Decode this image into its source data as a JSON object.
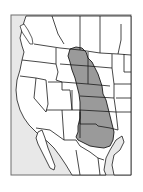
{
  "map": {
    "title": "",
    "region": "Western and Central United States with northern Mexico",
    "colors": {
      "background": "#ffffff",
      "ocean": "#e8e8e8",
      "land": "#ffffff",
      "border": "#1a1a1a",
      "highlight_range": "#9a9a9a",
      "frame": "#6e6e6e"
    },
    "legend": [],
    "labels": []
  }
}
